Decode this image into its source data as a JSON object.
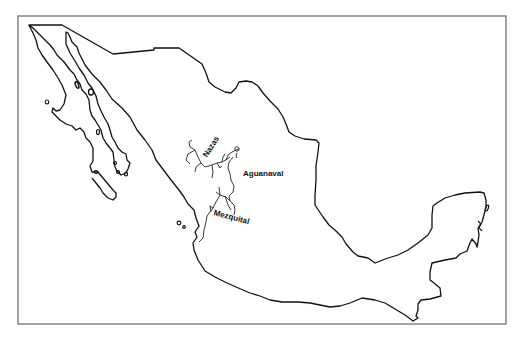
{
  "map": {
    "title": "",
    "region": "Mexico",
    "frame_color": "#666666",
    "outline_color": "#111111",
    "background": "#ffffff"
  },
  "labels": {
    "nazas": "Nazas",
    "aguanaval": "Aguanaval",
    "mezquital": "Mezquital"
  }
}
